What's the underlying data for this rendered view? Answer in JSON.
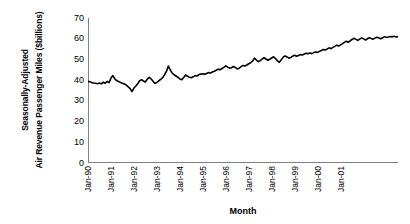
{
  "chart_data": {
    "type": "line",
    "title": "",
    "subtitle": "",
    "xlabel": "Month",
    "ylabel_line1": "Seasonally-Adjusted",
    "ylabel_line2": "Air Revenue Passenger Miles ($billions)",
    "ylim": [
      0,
      70
    ],
    "yticks": [
      70,
      60,
      50,
      40,
      30,
      20,
      10,
      0
    ],
    "ytick_labels": [
      "70",
      "60",
      "50",
      "40",
      "30",
      "20",
      "10",
      "0"
    ],
    "xtick_labels": [
      "Jan-90",
      "Jan-91",
      "Jan-92",
      "Jan-93",
      "Jan-94",
      "Jan-95",
      "Jan-96",
      "Jan-97",
      "Jan-98",
      "Jan-99",
      "Jan-00",
      "Jan-01"
    ],
    "grid": false,
    "legend": false,
    "legend_position": "none",
    "line_color": "#000000",
    "line_width": 1.6,
    "axis_color": "#808080",
    "x_start_label": "Jan-90",
    "x_end_label": "Jul-01",
    "series": [
      {
        "name": "Seasonally-Adjusted Air Revenue Passenger Miles",
        "values": [
          39.4,
          39.2,
          38.8,
          38.6,
          38.5,
          38.3,
          38.6,
          38.2,
          39.0,
          38.5,
          39.4,
          38.8,
          41.0,
          42.2,
          40.6,
          39.8,
          39.3,
          38.9,
          38.5,
          38.2,
          37.6,
          36.8,
          35.9,
          34.5,
          36.2,
          37.2,
          38.3,
          39.7,
          40.2,
          39.6,
          39.1,
          40.5,
          41.3,
          40.6,
          39.5,
          38.4,
          38.9,
          39.7,
          40.4,
          41.2,
          42.6,
          44.2,
          46.8,
          44.9,
          43.4,
          42.6,
          42.0,
          41.3,
          40.6,
          40.2,
          41.3,
          42.5,
          41.9,
          41.4,
          41.2,
          41.6,
          42.2,
          42.0,
          42.7,
          42.9,
          43.1,
          42.8,
          43.2,
          43.7,
          43.4,
          43.9,
          44.3,
          44.8,
          45.3,
          45.0,
          45.6,
          46.2,
          46.9,
          46.3,
          45.8,
          46.0,
          46.6,
          46.1,
          45.4,
          45.8,
          46.5,
          47.1,
          46.8,
          47.3,
          47.9,
          48.4,
          49.2,
          50.6,
          49.7,
          48.9,
          49.4,
          50.2,
          50.8,
          50.2,
          49.6,
          50.1,
          50.7,
          51.3,
          50.4,
          49.3,
          48.6,
          49.8,
          51.1,
          51.7,
          51.2,
          50.6,
          51.0,
          51.6,
          52.0,
          51.5,
          51.9,
          52.4,
          52.1,
          52.6,
          53.0,
          52.7,
          53.1,
          52.8,
          53.3,
          53.6,
          53.4,
          53.9,
          54.3,
          54.8,
          54.5,
          55.1,
          55.6,
          55.2,
          55.8,
          56.3,
          56.9,
          56.4,
          57.0,
          57.6,
          58.2,
          58.8,
          58.3,
          59.0,
          59.6,
          60.2,
          59.7,
          59.2,
          59.8,
          60.4,
          59.9,
          59.4,
          60.0,
          60.5,
          60.1,
          59.8,
          60.3,
          60.7,
          60.4,
          60.0,
          60.5,
          61.0,
          60.6,
          60.8,
          61.1,
          60.9,
          61.2,
          60.8,
          61.0
        ]
      }
    ]
  }
}
